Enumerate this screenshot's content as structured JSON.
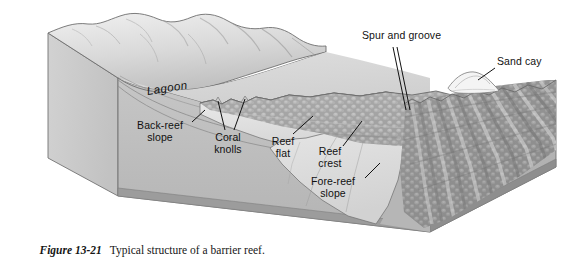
{
  "figure": {
    "number": "Figure 13-21",
    "caption": "Typical structure of a barrier reef."
  },
  "colors": {
    "background": "#ffffff",
    "ink": "#111111",
    "block_left_face": "#c9c9c9",
    "block_front_face": "#bdbdbd",
    "block_right_face": "#b2b2b2",
    "block_base_band": "#9a9a9a",
    "land_light": "#e8e8e8",
    "land_shadow": "#b8b8b8",
    "lagoon_floor": "#d4d4d4",
    "reef_texture": "#a8a8a8",
    "reef_highlight": "#d8d8d8",
    "sand_cay": "#f2f2f2",
    "outline": "#5a5a5a"
  },
  "labels": [
    {
      "id": "spur-and-groove",
      "text": "Spur and groove",
      "align": "left",
      "x": 362,
      "y": 36
    },
    {
      "id": "sand-cay",
      "text": "Sand cay",
      "align": "left",
      "x": 497,
      "y": 62
    },
    {
      "id": "lagoon",
      "text": "Lagoon",
      "align": "left",
      "x": 148,
      "y": 86
    },
    {
      "id": "back-reef-slope",
      "text": "Back-reef\nslope",
      "align": "center",
      "x": 160,
      "y": 122
    },
    {
      "id": "coral-knolls",
      "text": "Coral\nknolls",
      "align": "center",
      "x": 228,
      "y": 133
    },
    {
      "id": "reef-flat",
      "text": "Reef\nflat",
      "align": "center",
      "x": 283,
      "y": 137
    },
    {
      "id": "reef-crest",
      "text": "Reef\ncrest",
      "align": "center",
      "x": 330,
      "y": 147
    },
    {
      "id": "fore-reef-slope",
      "text": "Fore-reef\nslope",
      "align": "center",
      "x": 337,
      "y": 178
    }
  ],
  "leader_lines": [
    {
      "id": "leader-spur-groove-a",
      "from": [
        393,
        47
      ],
      "to": [
        406,
        110
      ]
    },
    {
      "id": "leader-spur-groove-b",
      "from": [
        397,
        47
      ],
      "to": [
        410,
        110
      ]
    },
    {
      "id": "leader-sand-cay",
      "from": [
        495,
        68
      ],
      "to": [
        478,
        80
      ]
    },
    {
      "id": "leader-back-reef",
      "from": [
        192,
        122
      ],
      "to": [
        205,
        110
      ]
    },
    {
      "id": "leader-coral-knolls-a",
      "from": [
        225,
        130
      ],
      "to": [
        218,
        103
      ]
    },
    {
      "id": "leader-coral-knolls-b",
      "from": [
        234,
        130
      ],
      "to": [
        245,
        103
      ]
    },
    {
      "id": "leader-reef-flat",
      "from": [
        293,
        134
      ],
      "to": [
        313,
        116
      ]
    },
    {
      "id": "leader-reef-crest",
      "from": [
        343,
        146
      ],
      "to": [
        362,
        121
      ]
    },
    {
      "id": "leader-fore-reef",
      "from": [
        365,
        178
      ],
      "to": [
        380,
        163
      ]
    }
  ],
  "features": [
    "hilly land surface",
    "shoreline",
    "lagoon",
    "back-reef slope",
    "coral knolls",
    "reef flat",
    "reef crest",
    "fore-reef slope",
    "spur and groove",
    "sand cay"
  ]
}
